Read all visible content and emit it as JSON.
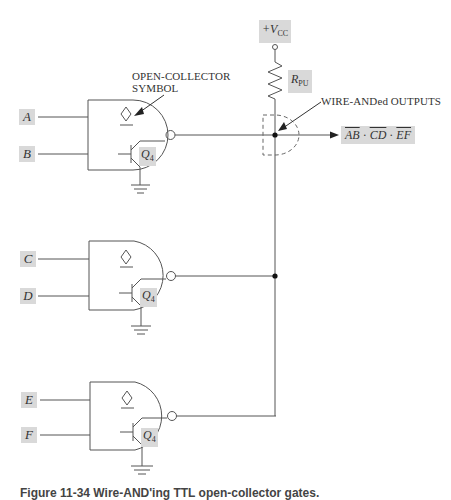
{
  "diagram": {
    "supply": {
      "label_prefix": "+V",
      "label_sub": "CC"
    },
    "pullup": {
      "label_main": "R",
      "label_sub": "PU"
    },
    "annotations": {
      "open_collector_line1": "OPEN-COLLECTOR",
      "open_collector_line2": "SYMBOL",
      "wire_anded": "WIRE-ANDed OUTPUTS"
    },
    "output": {
      "terms": [
        "AB",
        "CD",
        "EF"
      ],
      "separator": "·"
    },
    "gates": [
      {
        "inputs": [
          "A",
          "B"
        ],
        "transistor": {
          "main": "Q",
          "sub": "4"
        }
      },
      {
        "inputs": [
          "C",
          "D"
        ],
        "transistor": {
          "main": "Q",
          "sub": "4"
        }
      },
      {
        "inputs": [
          "E",
          "F"
        ],
        "transistor": {
          "main": "Q",
          "sub": "4"
        }
      }
    ]
  },
  "caption": "Figure 11-34   Wire-AND'ing TTL open-collector gates."
}
